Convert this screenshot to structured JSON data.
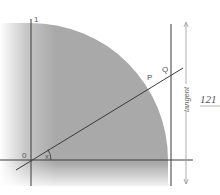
{
  "diagram": {
    "labels": {
      "y_axis_one": "1",
      "origin": "0",
      "angle": "x",
      "point_p": "P",
      "point_q": "Q",
      "tangent": "tangent"
    },
    "page_number": "121",
    "colors": {
      "fill": "#a9a9a9",
      "line": "#3a3a3a",
      "arrow": "#9a9a9a",
      "text": "#555555"
    },
    "geometry": {
      "origin": [
        31,
        160
      ],
      "radius": 137,
      "tangent_x": 171,
      "secant_start": [
        16,
        170
      ],
      "secant_end": [
        183,
        68
      ],
      "point_p": [
        151,
        86
      ],
      "point_q": [
        171,
        73
      ]
    }
  }
}
